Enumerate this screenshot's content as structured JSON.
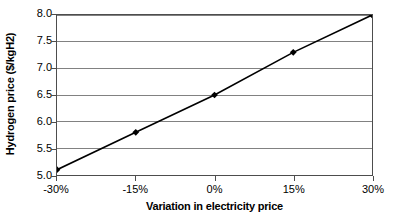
{
  "chart_data": {
    "type": "line",
    "title": "",
    "xlabel": "Variation in electricity price",
    "ylabel": "Hydrogen price ($/kgH2)",
    "categories": [
      "-30%",
      "-15%",
      "0%",
      "15%",
      "30%"
    ],
    "x": [
      -30,
      -15,
      0,
      15,
      30
    ],
    "values": [
      5.1,
      5.8,
      6.5,
      7.3,
      8.0
    ],
    "series": [
      {
        "name": "Hydrogen price",
        "values": [
          5.1,
          5.8,
          6.5,
          7.3,
          8.0
        ]
      }
    ],
    "ylim": [
      5.0,
      8.0
    ],
    "yticks": [
      5.0,
      5.5,
      6.0,
      6.5,
      7.0,
      7.5,
      8.0
    ],
    "ytick_labels": [
      "5.0",
      "5.5",
      "6.0",
      "6.5",
      "7.0",
      "7.5",
      "8.0"
    ],
    "xtick_labels": [
      "-30%",
      "-15%",
      "0%",
      "15%",
      "30%"
    ],
    "grid": "horizontal",
    "legend": "none",
    "marker": "diamond",
    "line_color": "#000000",
    "marker_color": "#000000",
    "gridline_color": "#808080",
    "axis_color": "#4d4d4d",
    "background_color": "#ffffff"
  }
}
